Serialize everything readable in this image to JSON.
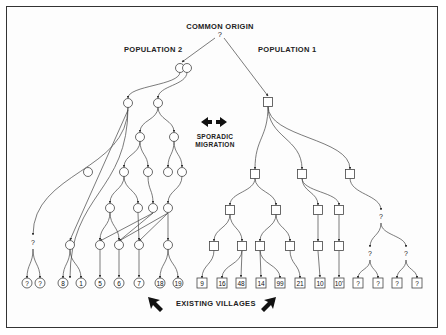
{
  "title": "COMMON ORIGIN",
  "origin_mark": "?",
  "population_2_label": "POPULATION 2",
  "population_1_label": "POPULATION 1",
  "migration_label_line1": "SPORADIC",
  "migration_label_line2": "MIGRATION",
  "existing_villages_label": "EXISTING VILLAGES",
  "colors": {
    "ink": "#333333",
    "background": "#fdfdfd"
  },
  "legend": {
    "circle": "Population 2 village",
    "square": "Population 1 village"
  },
  "nodes": [
    {
      "id": "p2root_a",
      "shape": "circle",
      "x": 180,
      "y": 68
    },
    {
      "id": "p2root_b",
      "shape": "circle",
      "x": 187,
      "y": 68
    },
    {
      "id": "c1",
      "shape": "circle",
      "x": 128,
      "y": 103
    },
    {
      "id": "c2",
      "shape": "circle",
      "x": 158,
      "y": 103
    },
    {
      "id": "c3",
      "shape": "circle",
      "x": 140,
      "y": 137
    },
    {
      "id": "c4",
      "shape": "circle",
      "x": 174,
      "y": 137
    },
    {
      "id": "c5",
      "shape": "circle",
      "x": 88,
      "y": 172
    },
    {
      "id": "c6",
      "shape": "circle",
      "x": 124,
      "y": 172
    },
    {
      "id": "c7",
      "shape": "circle",
      "x": 148,
      "y": 172
    },
    {
      "id": "c8",
      "shape": "circle",
      "x": 168,
      "y": 172
    },
    {
      "id": "c9",
      "shape": "circle",
      "x": 182,
      "y": 172
    },
    {
      "id": "c10",
      "shape": "circle",
      "x": 110,
      "y": 208
    },
    {
      "id": "c11",
      "shape": "circle",
      "x": 138,
      "y": 208
    },
    {
      "id": "c12",
      "shape": "circle",
      "x": 153,
      "y": 208
    },
    {
      "id": "c13",
      "shape": "circle",
      "x": 168,
      "y": 208
    },
    {
      "id": "c14",
      "shape": "circle",
      "x": 70,
      "y": 245
    },
    {
      "id": "c15",
      "shape": "circle",
      "x": 100,
      "y": 245
    },
    {
      "id": "c16",
      "shape": "circle",
      "x": 119,
      "y": 245
    },
    {
      "id": "c17",
      "shape": "circle",
      "x": 139,
      "y": 245
    },
    {
      "id": "c18",
      "shape": "circle",
      "x": 168,
      "y": 245
    },
    {
      "id": "q1",
      "shape": "mark",
      "x": 33,
      "y": 243,
      "label": "?"
    },
    {
      "id": "s_root",
      "shape": "square",
      "x": 268,
      "y": 102
    },
    {
      "id": "s1",
      "shape": "square",
      "x": 255,
      "y": 174
    },
    {
      "id": "s2",
      "shape": "square",
      "x": 302,
      "y": 174
    },
    {
      "id": "s3",
      "shape": "square",
      "x": 350,
      "y": 174
    },
    {
      "id": "s4",
      "shape": "square",
      "x": 230,
      "y": 210
    },
    {
      "id": "s5",
      "shape": "square",
      "x": 276,
      "y": 210
    },
    {
      "id": "s6",
      "shape": "square",
      "x": 318,
      "y": 210
    },
    {
      "id": "s7",
      "shape": "square",
      "x": 339,
      "y": 210
    },
    {
      "id": "s8",
      "shape": "square",
      "x": 214,
      "y": 246
    },
    {
      "id": "s9",
      "shape": "square",
      "x": 242,
      "y": 246
    },
    {
      "id": "s10",
      "shape": "square",
      "x": 260,
      "y": 246
    },
    {
      "id": "s11",
      "shape": "square",
      "x": 290,
      "y": 246
    },
    {
      "id": "s12",
      "shape": "square",
      "x": 318,
      "y": 246
    },
    {
      "id": "s13",
      "shape": "square",
      "x": 339,
      "y": 246
    },
    {
      "id": "q2",
      "shape": "mark",
      "x": 381,
      "y": 217,
      "label": "?"
    },
    {
      "id": "q3",
      "shape": "mark",
      "x": 370,
      "y": 254,
      "label": "?"
    },
    {
      "id": "q4",
      "shape": "mark",
      "x": 406,
      "y": 254,
      "label": "?"
    }
  ],
  "villages": [
    {
      "shape": "circle",
      "x": 27,
      "label": "?"
    },
    {
      "shape": "circle",
      "x": 40,
      "label": "?"
    },
    {
      "shape": "circle",
      "x": 63,
      "label": "8"
    },
    {
      "shape": "circle",
      "x": 81,
      "label": "1"
    },
    {
      "shape": "circle",
      "x": 100,
      "label": "5"
    },
    {
      "shape": "circle",
      "x": 119,
      "label": "6"
    },
    {
      "shape": "circle",
      "x": 139,
      "label": "7"
    },
    {
      "shape": "circle",
      "x": 160,
      "label": "18"
    },
    {
      "shape": "circle",
      "x": 178,
      "label": "19"
    },
    {
      "shape": "square",
      "x": 202,
      "label": "9"
    },
    {
      "shape": "square",
      "x": 222,
      "label": "16"
    },
    {
      "shape": "square",
      "x": 241,
      "label": "48"
    },
    {
      "shape": "square",
      "x": 261,
      "label": "14"
    },
    {
      "shape": "square",
      "x": 280,
      "label": "99"
    },
    {
      "shape": "square",
      "x": 300,
      "label": "21"
    },
    {
      "shape": "square",
      "x": 320,
      "label": "10"
    },
    {
      "shape": "square",
      "x": 339,
      "label": "10'"
    },
    {
      "shape": "square",
      "x": 358,
      "label": "?"
    },
    {
      "shape": "square",
      "x": 378,
      "label": "?"
    },
    {
      "shape": "square",
      "x": 397,
      "label": "?"
    },
    {
      "shape": "square",
      "x": 417,
      "label": "?"
    }
  ],
  "village_row_y": 283
}
